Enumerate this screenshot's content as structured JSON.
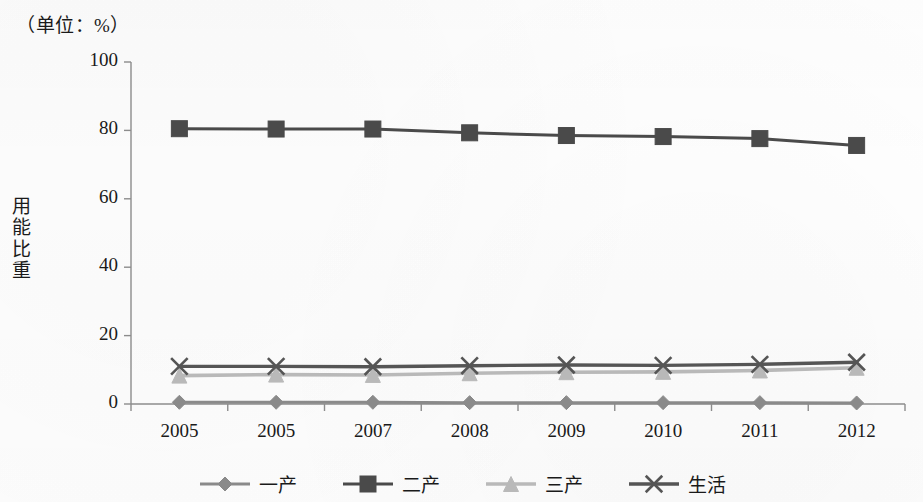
{
  "figure": {
    "unit_title": "（单位：%）",
    "y_axis_title_chars": [
      "用",
      "能",
      "比",
      "重"
    ]
  },
  "chart_data": {
    "type": "line",
    "title": "（单位：%）",
    "xlabel": "",
    "ylabel": "用能比重",
    "unit_note": "（单位：%）",
    "categories": [
      "2005",
      "2005",
      "2007",
      "2008",
      "2009",
      "2010",
      "2011",
      "2012"
    ],
    "ylim": [
      0,
      100
    ],
    "yticks": [
      0,
      20,
      40,
      60,
      80,
      100
    ],
    "ytick_labels": [
      "0",
      "20",
      "40",
      "60",
      "80",
      "100"
    ],
    "grid": false,
    "legend_position": "bottom",
    "series": [
      {
        "name": "一产",
        "marker": "diamond",
        "color": "#8a8a8a",
        "values": [
          0.5,
          0.5,
          0.5,
          0.4,
          0.4,
          0.4,
          0.4,
          0.3
        ]
      },
      {
        "name": "二产",
        "marker": "square",
        "color": "#4a4a4a",
        "values": [
          80.5,
          80.4,
          80.4,
          79.3,
          78.5,
          78.2,
          77.6,
          75.6
        ]
      },
      {
        "name": "三产",
        "marker": "triangle",
        "color": "#b9b9b9",
        "values": [
          8.3,
          8.6,
          8.5,
          9.0,
          9.3,
          9.4,
          9.8,
          10.6
        ]
      },
      {
        "name": "生活",
        "marker": "cross",
        "color": "#555555",
        "values": [
          11.0,
          11.0,
          10.9,
          11.2,
          11.4,
          11.3,
          11.6,
          12.2
        ]
      }
    ]
  }
}
